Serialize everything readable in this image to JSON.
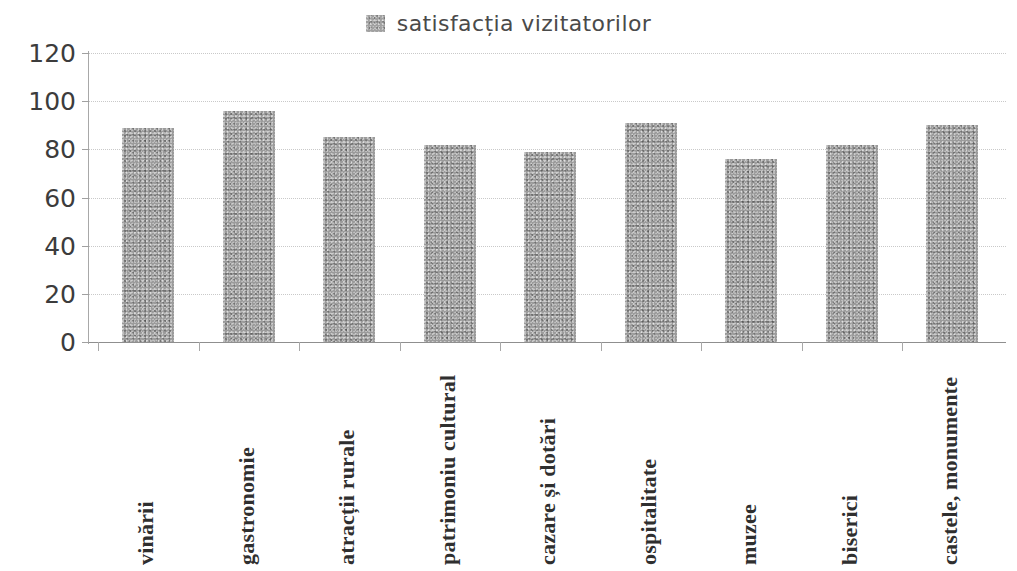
{
  "chart_data": {
    "type": "bar",
    "title": "",
    "subtitle": "",
    "xlabel": "",
    "ylabel": "",
    "ylim": [
      0,
      120
    ],
    "ytick_step": 20,
    "yticks": [
      120,
      100,
      80,
      60,
      40,
      20,
      0
    ],
    "grid": true,
    "legend_position": "top-center",
    "legend": [
      "satisfacția vizitatorilor"
    ],
    "categories": [
      "vinării",
      "gastronomie",
      "atracții  rurale",
      "patrimoniu cultural",
      "cazare și dotări",
      "ospitalitate",
      "muzee",
      "biserici",
      "castele, monumente"
    ],
    "series": [
      {
        "name": "satisfacția vizitatorilor",
        "values": [
          89,
          96,
          85,
          82,
          79,
          91,
          76,
          82,
          90
        ]
      }
    ],
    "colors": {
      "bar": "#9b9b9b",
      "grid": "#c9c9c9",
      "axis": "#8f8f8f",
      "text": "#3c3c3c"
    }
  },
  "legend": {
    "swatch_icon": "legend-square-icon",
    "label": "satisfacția vizitatorilor"
  },
  "axes": {
    "y_labels": [
      "120",
      "100",
      "80",
      "60",
      "40",
      "20",
      "0"
    ],
    "x_labels": [
      "vinării",
      "gastronomie",
      "atracții  rurale",
      "patrimoniu cultural",
      "cazare și dotări",
      "ospitalitate",
      "muzee",
      "biserici",
      "castele, monumente"
    ]
  }
}
